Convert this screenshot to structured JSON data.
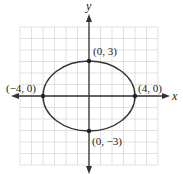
{
  "chart_data": {
    "type": "line",
    "title": "",
    "xlabel": "x",
    "ylabel": "y",
    "xlim": [
      -6,
      6
    ],
    "ylim": [
      -6,
      6
    ],
    "grid": true,
    "curve": {
      "kind": "ellipse",
      "equation": "x^2/16 + y^2/9 = 1",
      "center": [
        0,
        0
      ],
      "semi_major_x": 4,
      "semi_minor_y": 3
    },
    "points": [
      {
        "x": 0,
        "y": 3,
        "label": "(0, 3)"
      },
      {
        "x": 4,
        "y": 0,
        "label": "(4, 0)"
      },
      {
        "x": 0,
        "y": -3,
        "label": "(0, −3)"
      },
      {
        "x": -4,
        "y": 0,
        "label": "(−4, 0)"
      }
    ]
  },
  "colors": {
    "grid": "#d9d9d9",
    "axis": "#333333",
    "curve": "#333333"
  }
}
